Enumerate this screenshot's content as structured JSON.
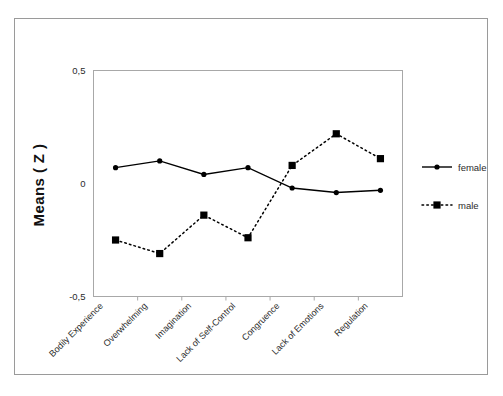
{
  "figure": {
    "y_axis_title": "Means ( Z )"
  },
  "legend": {
    "position": "right",
    "entries": [
      {
        "label": "female",
        "marker": "circle-marker-icon",
        "line": "solid"
      },
      {
        "label": "male",
        "marker": "square-marker-icon",
        "line": "dotted"
      }
    ]
  },
  "chart_data": {
    "type": "line",
    "title": "",
    "xlabel": "",
    "ylabel": "Means ( Z )",
    "ylim": [
      -0.5,
      0.5
    ],
    "yticks": [
      0.5,
      0,
      -0.5
    ],
    "ytick_labels": [
      "0,5",
      "0",
      "-0,5"
    ],
    "grid": false,
    "legend_position": "right",
    "categories": [
      "Bodily Experience",
      "Overwhelming",
      "Imagination",
      "Lack of Self-Control",
      "Congruence",
      "Lack of Emotions",
      "Regulation"
    ],
    "series": [
      {
        "name": "female",
        "marker": "circle",
        "linestyle": "solid",
        "color": "#000000",
        "values": [
          0.07,
          0.1,
          0.04,
          0.07,
          -0.02,
          -0.04,
          -0.03
        ]
      },
      {
        "name": "male",
        "marker": "square",
        "linestyle": "dotted",
        "color": "#000000",
        "values": [
          -0.25,
          -0.31,
          -0.14,
          -0.24,
          0.08,
          0.22,
          0.11
        ]
      }
    ]
  }
}
